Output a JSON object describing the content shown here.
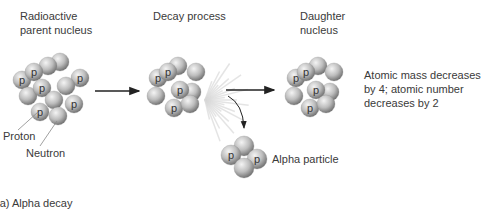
{
  "labels": {
    "parent": [
      "Radioactive",
      "parent nucleus"
    ],
    "decay": "Decay process",
    "daughter": [
      "Daughter",
      "nucleus"
    ],
    "result": [
      "Atomic mass decreases",
      "by 4;  atomic number",
      "decreases by 2"
    ],
    "alpha": "Alpha particle",
    "proton": "Proton",
    "neutron": "Neutron",
    "caption": "(a)  Alpha decay"
  },
  "proton_symbol": "p",
  "colors": {
    "sphere_light": "#f2f2f2",
    "sphere_mid": "#b8b8b8",
    "sphere_dark": "#6e6e6e",
    "arrow": "#222222",
    "burst": "#d8d8d8"
  }
}
